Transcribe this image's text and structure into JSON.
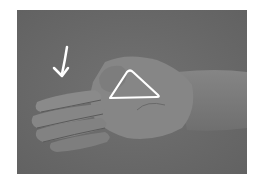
{
  "image": {
    "description": "Grayscale photo of an open left hand, palm up, with a white arrow pointing down toward the fingers and a white triangle outline drawn on the palm near the thumb",
    "colors": {
      "background": "#ffffff",
      "photo_bg": "#6b6b6b",
      "skin_light": "#8e8e8e",
      "skin_mid": "#7c7c7c",
      "skin_shadow": "#5a5a5a",
      "annotation": "#ffffff"
    },
    "annotations": [
      {
        "type": "arrow",
        "direction": "down-left",
        "icon": "arrow-down-icon"
      },
      {
        "type": "triangle",
        "icon": "triangle-outline-icon"
      }
    ]
  }
}
